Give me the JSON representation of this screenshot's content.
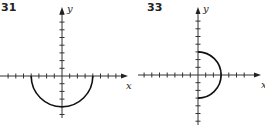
{
  "chart_data": [
    {
      "type": "line",
      "title": "31",
      "xlabel": "x",
      "ylabel": "y",
      "xlim": [
        -7,
        8
      ],
      "ylim": [
        -5,
        9
      ],
      "tick_spacing": 1,
      "grid": false,
      "curve": "lower semicircle, radius 4, centered at origin: y = -sqrt(16 - x^2)",
      "x": [
        -4,
        -3,
        -2,
        -1,
        0,
        1,
        2,
        3,
        4
      ],
      "y": [
        0,
        -2.65,
        -3.46,
        -3.87,
        -4,
        -3.87,
        -3.46,
        -2.65,
        0
      ]
    },
    {
      "type": "line",
      "title": "33",
      "xlabel": "x",
      "ylabel": "y",
      "xlim": [
        -7,
        7
      ],
      "ylim": [
        -6,
        8
      ],
      "tick_spacing": 1,
      "grid": false,
      "curve": "right semicircle, radius 3, centered at origin: x = sqrt(9 - y^2)",
      "x": [
        0,
        1.66,
        2.24,
        2.6,
        2.83,
        3,
        2.83,
        2.6,
        2.24,
        1.66,
        0
      ],
      "y": [
        3,
        2.5,
        2,
        1.5,
        1,
        0,
        -1,
        -1.5,
        -2,
        -2.5,
        -3
      ]
    }
  ],
  "panels": [
    {
      "number": "31",
      "x_axis_label": "x",
      "y_axis_label": "y"
    },
    {
      "number": "33",
      "x_axis_label": "x",
      "y_axis_label": "y"
    }
  ]
}
